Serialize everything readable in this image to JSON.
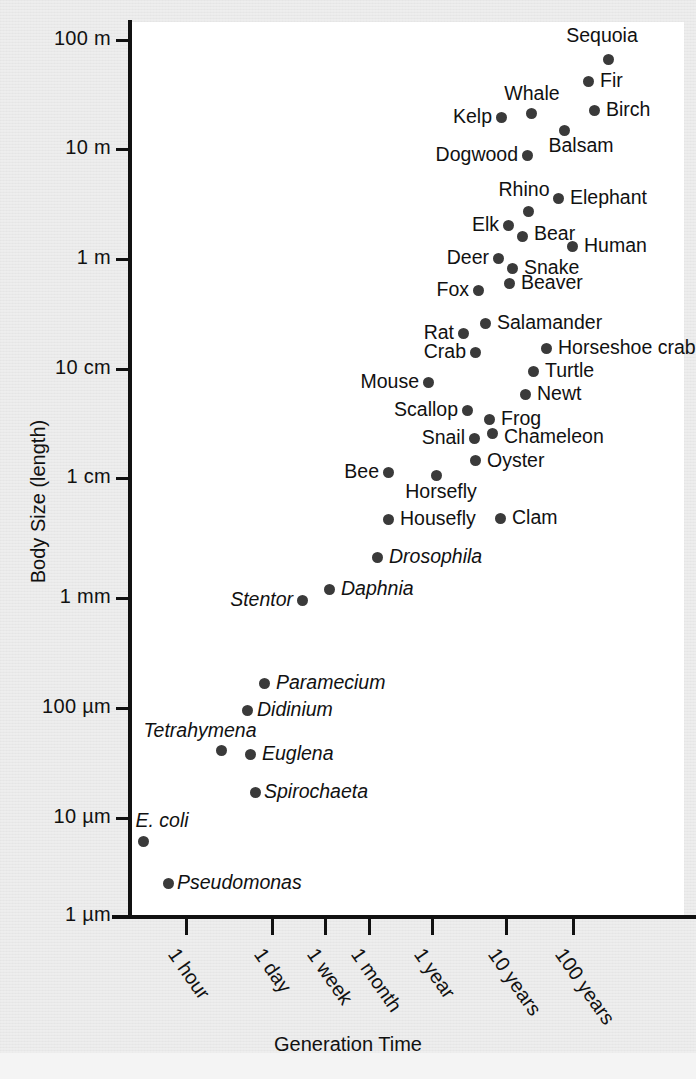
{
  "chart_data": {
    "type": "scatter",
    "title": "",
    "xlabel": "Generation Time",
    "ylabel": "Body Size (length)",
    "xscale": "log",
    "yscale": "log",
    "grid": false,
    "legend": null,
    "x_tick_labels": [
      "1 hour",
      "1 day",
      "1 week",
      "1 month",
      "1 year",
      "10 years",
      "100 years"
    ],
    "y_tick_labels": [
      "100 m",
      "10 m",
      "1 m",
      "10 cm",
      "1 cm",
      "1 mm",
      "100 µm",
      "10 µm",
      "1 µm"
    ],
    "y_tick_values_m": [
      100,
      10,
      1,
      0.1,
      0.01,
      0.001,
      0.0001,
      1e-05,
      1e-06
    ],
    "points": [
      {
        "label": "Sequoia",
        "x_label": "~30 years",
        "y_label": "~60 m",
        "italic": false,
        "pos": "above"
      },
      {
        "label": "Fir",
        "x_label": "~15 years",
        "y_label": "~35 m",
        "italic": false,
        "pos": "right-of"
      },
      {
        "label": "Whale",
        "x_label": "~3 years",
        "y_label": "~22 m",
        "italic": false,
        "pos": "above"
      },
      {
        "label": "Birch",
        "x_label": "~12 years",
        "y_label": "~22 m",
        "italic": false,
        "pos": "right-of"
      },
      {
        "label": "Kelp",
        "x_label": "~1.5 years",
        "y_label": "~20 m",
        "italic": false,
        "pos": "left-of"
      },
      {
        "label": "Balsam",
        "x_label": "~7 years",
        "y_label": "~13 m",
        "italic": false,
        "pos": "below"
      },
      {
        "label": "Dogwood",
        "x_label": "~2 years",
        "y_label": "~9 m",
        "italic": false,
        "pos": "left-of"
      },
      {
        "label": "Elephant",
        "x_label": "~8 years",
        "y_label": "~4 m",
        "italic": false,
        "pos": "right-of"
      },
      {
        "label": "Rhino",
        "x_label": "~4 years",
        "y_label": "~3 m",
        "italic": false,
        "pos": "above"
      },
      {
        "label": "Elk",
        "x_label": "~2 years",
        "y_label": "~2.2 m",
        "italic": false,
        "pos": "left-of"
      },
      {
        "label": "Bear",
        "x_label": "~2.5 years",
        "y_label": "~1.7 m",
        "italic": false,
        "pos": "right-of"
      },
      {
        "label": "Human",
        "x_label": "~6 years",
        "y_label": "~1.6 m",
        "italic": false,
        "pos": "right-of"
      },
      {
        "label": "Deer",
        "x_label": "~1.5 years",
        "y_label": "~1.2 m",
        "italic": false,
        "pos": "left-of"
      },
      {
        "label": "Snake",
        "x_label": "~2 years",
        "y_label": "~0.9 m",
        "italic": false,
        "pos": "right-of"
      },
      {
        "label": "Beaver",
        "x_label": "~2 years",
        "y_label": "~0.7 m",
        "italic": false,
        "pos": "right-of"
      },
      {
        "label": "Fox",
        "x_label": "~1 year",
        "y_label": "~0.7 m",
        "italic": false,
        "pos": "left-of"
      },
      {
        "label": "Salamander",
        "x_label": "~1 year",
        "y_label": "~25 cm",
        "italic": false,
        "pos": "right-of"
      },
      {
        "label": "Rat",
        "x_label": "~5 months",
        "y_label": "~20 cm",
        "italic": false,
        "pos": "left-of"
      },
      {
        "label": "Horseshoe crab",
        "x_label": "~7 years",
        "y_label": "~18 cm",
        "italic": false,
        "pos": "right-of"
      },
      {
        "label": "Crab",
        "x_label": "~6 months",
        "y_label": "~14 cm",
        "italic": false,
        "pos": "left-of"
      },
      {
        "label": "Turtle",
        "x_label": "~5 years",
        "y_label": "~11 cm",
        "italic": false,
        "pos": "right-of"
      },
      {
        "label": "Mouse",
        "x_label": "~2 months",
        "y_label": "~8 cm",
        "italic": false,
        "pos": "left-of"
      },
      {
        "label": "Newt",
        "x_label": "~2 years",
        "y_label": "~6.5 cm",
        "italic": false,
        "pos": "right-of"
      },
      {
        "label": "Scallop",
        "x_label": "~5 months",
        "y_label": "~5 cm",
        "italic": false,
        "pos": "left-of"
      },
      {
        "label": "Frog",
        "x_label": "~1 year",
        "y_label": "~4.2 cm",
        "italic": false,
        "pos": "right-of"
      },
      {
        "label": "Chameleon",
        "x_label": "~1.2 years",
        "y_label": "~3.2 cm",
        "italic": false,
        "pos": "right-of"
      },
      {
        "label": "Snail",
        "x_label": "~8 months",
        "y_label": "~3 cm",
        "italic": false,
        "pos": "left-of"
      },
      {
        "label": "Oyster",
        "x_label": "~1 year",
        "y_label": "~2 cm",
        "italic": false,
        "pos": "right-of"
      },
      {
        "label": "Bee",
        "x_label": "~1 month",
        "y_label": "~1.3 cm",
        "italic": false,
        "pos": "left-of"
      },
      {
        "label": "Horsefly",
        "x_label": "~2 months",
        "y_label": "~1.2 cm",
        "italic": false,
        "pos": "below"
      },
      {
        "label": "Housefly",
        "x_label": "~3 weeks",
        "y_label": "~5 mm",
        "italic": false,
        "pos": "right-of"
      },
      {
        "label": "Clam",
        "x_label": "~2 years",
        "y_label": "~5 mm",
        "italic": false,
        "pos": "right-of"
      },
      {
        "label": "Drosophila",
        "x_label": "~2 weeks",
        "y_label": "~2.5 mm",
        "italic": true,
        "pos": "right-of"
      },
      {
        "label": "Daphnia",
        "x_label": "~4 days",
        "y_label": "~1.3 mm",
        "italic": true,
        "pos": "right-of"
      },
      {
        "label": "Stentor",
        "x_label": "~2 days",
        "y_label": "~1 mm",
        "italic": true,
        "pos": "left-of"
      },
      {
        "label": "Paramecium",
        "x_label": "~12 hours",
        "y_label": "~150 µm",
        "italic": true,
        "pos": "right-of"
      },
      {
        "label": "Didinium",
        "x_label": "~10 hours",
        "y_label": "~100 µm",
        "italic": true,
        "pos": "right-of"
      },
      {
        "label": "Tetrahymena",
        "x_label": "~5 hours",
        "y_label": "~45 µm",
        "italic": true,
        "pos": "above"
      },
      {
        "label": "Euglena",
        "x_label": "~8 hours",
        "y_label": "~40 µm",
        "italic": true,
        "pos": "right-of"
      },
      {
        "label": "Spirochaeta",
        "x_label": "~9 hours",
        "y_label": "~20 µm",
        "italic": true,
        "pos": "right-of"
      },
      {
        "label": "E. coli",
        "x_label": "~30 min",
        "y_label": "~4 µm",
        "italic": true,
        "pos": "above"
      },
      {
        "label": "Pseudomonas",
        "x_label": "~45 min",
        "y_label": "~3 µm",
        "italic": true,
        "pos": "right-of"
      }
    ]
  },
  "axes": {
    "y_ticks": [
      {
        "label": "100 m",
        "py": 40
      },
      {
        "label": "10 m",
        "py": 149
      },
      {
        "label": "1 m",
        "py": 259
      },
      {
        "label": "10 cm",
        "py": 369
      },
      {
        "label": "1 cm",
        "py": 478
      },
      {
        "label": "1 mm",
        "py": 598
      },
      {
        "label": "100 µm",
        "py": 708
      },
      {
        "label": "10 µm",
        "py": 818
      },
      {
        "label": "1 µm",
        "py": 916
      }
    ],
    "x_ticks": [
      {
        "label": "1 hour",
        "px": 186
      },
      {
        "label": "1 day",
        "px": 272
      },
      {
        "label": "1 week",
        "px": 325
      },
      {
        "label": "1 month",
        "px": 369
      },
      {
        "label": "1 year",
        "px": 432
      },
      {
        "label": "10 years",
        "px": 506
      },
      {
        "label": "100 years",
        "px": 573
      }
    ],
    "x_title": "Generation Time",
    "y_title": "Body Size (length)"
  },
  "plot_points_px": [
    {
      "label": "Sequoia",
      "px": 608,
      "py": 59,
      "lx": 602,
      "ly": 45,
      "pos": "above",
      "italic": false
    },
    {
      "label": "Fir",
      "px": 588,
      "py": 81,
      "lx": 600,
      "ly": 81,
      "pos": "right-of",
      "italic": false
    },
    {
      "label": "Whale",
      "px": 531,
      "py": 113,
      "lx": 532,
      "ly": 103,
      "pos": "above",
      "italic": false
    },
    {
      "label": "Birch",
      "px": 594,
      "py": 110,
      "lx": 606,
      "ly": 110,
      "pos": "right-of",
      "italic": false
    },
    {
      "label": "Kelp",
      "px": 501,
      "py": 117,
      "lx": 492,
      "ly": 117,
      "pos": "left-of",
      "italic": false
    },
    {
      "label": "Balsam",
      "px": 564,
      "py": 130,
      "lx": 581,
      "ly": 136,
      "pos": "below",
      "italic": false
    },
    {
      "label": "Dogwood",
      "px": 527,
      "py": 155,
      "lx": 518,
      "ly": 155,
      "pos": "left-of",
      "italic": false
    },
    {
      "label": "Elephant",
      "px": 558,
      "py": 198,
      "lx": 570,
      "ly": 198,
      "pos": "right-of",
      "italic": false
    },
    {
      "label": "Rhino",
      "px": 528,
      "py": 211,
      "lx": 524,
      "ly": 199,
      "pos": "above",
      "italic": false
    },
    {
      "label": "Elk",
      "px": 508,
      "py": 225,
      "lx": 499,
      "ly": 225,
      "pos": "left-of",
      "italic": false
    },
    {
      "label": "Bear",
      "px": 522,
      "py": 236,
      "lx": 534,
      "ly": 234,
      "pos": "right-of",
      "italic": false
    },
    {
      "label": "Human",
      "px": 572,
      "py": 246,
      "lx": 584,
      "ly": 246,
      "pos": "right-of",
      "italic": false
    },
    {
      "label": "Deer",
      "px": 498,
      "py": 258,
      "lx": 489,
      "ly": 258,
      "pos": "left-of",
      "italic": false
    },
    {
      "label": "Snake",
      "px": 512,
      "py": 268,
      "lx": 524,
      "ly": 268,
      "pos": "right-of",
      "italic": false
    },
    {
      "label": "Beaver",
      "px": 509,
      "py": 283,
      "lx": 521,
      "ly": 283,
      "pos": "right-of",
      "italic": false
    },
    {
      "label": "Fox",
      "px": 478,
      "py": 290,
      "lx": 469,
      "ly": 290,
      "pos": "left-of",
      "italic": false
    },
    {
      "label": "Salamander",
      "px": 485,
      "py": 323,
      "lx": 497,
      "ly": 323,
      "pos": "right-of",
      "italic": false
    },
    {
      "label": "Rat",
      "px": 463,
      "py": 333,
      "lx": 454,
      "ly": 333,
      "pos": "left-of",
      "italic": false
    },
    {
      "label": "Horseshoe crab",
      "px": 546,
      "py": 348,
      "lx": 558,
      "ly": 348,
      "pos": "right-of",
      "italic": false
    },
    {
      "label": "Crab",
      "px": 475,
      "py": 352,
      "lx": 466,
      "ly": 352,
      "pos": "left-of",
      "italic": false
    },
    {
      "label": "Turtle",
      "px": 533,
      "py": 371,
      "lx": 545,
      "ly": 371,
      "pos": "right-of",
      "italic": false
    },
    {
      "label": "Mouse",
      "px": 428,
      "py": 382,
      "lx": 419,
      "ly": 382,
      "pos": "left-of",
      "italic": false
    },
    {
      "label": "Newt",
      "px": 525,
      "py": 394,
      "lx": 537,
      "ly": 394,
      "pos": "right-of",
      "italic": false
    },
    {
      "label": "Scallop",
      "px": 467,
      "py": 410,
      "lx": 458,
      "ly": 410,
      "pos": "left-of",
      "italic": false
    },
    {
      "label": "Frog",
      "px": 489,
      "py": 419,
      "lx": 501,
      "ly": 419,
      "pos": "right-of",
      "italic": false
    },
    {
      "label": "Chameleon",
      "px": 492,
      "py": 433,
      "lx": 504,
      "ly": 437,
      "pos": "right-of",
      "italic": false
    },
    {
      "label": "Snail",
      "px": 474,
      "py": 438,
      "lx": 465,
      "ly": 438,
      "pos": "left-of",
      "italic": false
    },
    {
      "label": "Oyster",
      "px": 475,
      "py": 460,
      "lx": 487,
      "ly": 461,
      "pos": "right-of",
      "italic": false
    },
    {
      "label": "Bee",
      "px": 388,
      "py": 472,
      "lx": 379,
      "ly": 472,
      "pos": "left-of",
      "italic": false
    },
    {
      "label": "Horsefly",
      "px": 436,
      "py": 475,
      "lx": 441,
      "ly": 482,
      "pos": "below",
      "italic": false
    },
    {
      "label": "Housefly",
      "px": 388,
      "py": 519,
      "lx": 400,
      "ly": 519,
      "pos": "right-of",
      "italic": false
    },
    {
      "label": "Clam",
      "px": 500,
      "py": 518,
      "lx": 512,
      "ly": 518,
      "pos": "right-of",
      "italic": false
    },
    {
      "label": "Drosophila",
      "px": 377,
      "py": 557,
      "lx": 389,
      "ly": 557,
      "pos": "right-of",
      "italic": true
    },
    {
      "label": "Daphnia",
      "px": 329,
      "py": 589,
      "lx": 341,
      "ly": 589,
      "pos": "right-of",
      "italic": true
    },
    {
      "label": "Stentor",
      "px": 302,
      "py": 600,
      "lx": 293,
      "ly": 600,
      "pos": "left-of",
      "italic": true
    },
    {
      "label": "Paramecium",
      "px": 264,
      "py": 683,
      "lx": 276,
      "ly": 683,
      "pos": "right-of",
      "italic": true
    },
    {
      "label": "Didinium",
      "px": 247,
      "py": 710,
      "lx": 257,
      "ly": 710,
      "pos": "right-of",
      "italic": true
    },
    {
      "label": "Tetrahymena",
      "px": 221,
      "py": 750,
      "lx": 200,
      "ly": 740,
      "pos": "above",
      "italic": true
    },
    {
      "label": "Euglena",
      "px": 250,
      "py": 754,
      "lx": 262,
      "ly": 754,
      "pos": "right-of",
      "italic": true
    },
    {
      "label": "Spirochaeta",
      "px": 255,
      "py": 792,
      "lx": 264,
      "ly": 792,
      "pos": "right-of",
      "italic": true
    },
    {
      "label": "E. coli",
      "px": 143,
      "py": 841,
      "lx": 162,
      "ly": 830,
      "pos": "above",
      "italic": true
    },
    {
      "label": "Pseudomonas",
      "px": 168,
      "py": 883,
      "lx": 177,
      "ly": 883,
      "pos": "right-of",
      "italic": true
    }
  ]
}
